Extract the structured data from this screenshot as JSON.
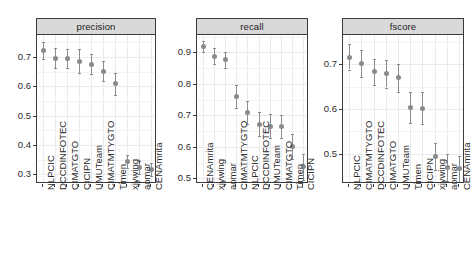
{
  "chart_data": {
    "type": "scatter",
    "title": "",
    "subtitle": "",
    "xlabel": "",
    "ylabel": "",
    "grid": true,
    "legend_position": "none",
    "facet_layout": "1x3",
    "marker": "point-with-error-bars",
    "colors": {
      "point": "#8a8a8a",
      "errorbar": "#8c8c8c",
      "strip_background": "#d9d9d9",
      "panel_border": "#3b3b3b",
      "grid_major": "#ebebeb",
      "grid_minor": "#f4f4f4",
      "panel_background": "#ffffff",
      "text": "#2b2b2b"
    },
    "panels": [
      {
        "name": "precision",
        "ylim": [
          0.27,
          0.775
        ],
        "yticks": [
          0.3,
          0.4,
          0.5,
          0.6,
          0.7
        ],
        "ytick_labels": [
          "0.3",
          "0.4",
          "0.5",
          "0.6",
          "0.7"
        ],
        "categories": [
          "NLPCIC",
          "DCCDINFOTEC",
          "CIMATGTO",
          "CICIPN",
          "UMUTeam",
          "CIMATMTYGTO",
          "Timen",
          "xjywing",
          "aomar",
          "CENAmrita"
        ],
        "values": [
          0.722,
          0.696,
          0.695,
          0.686,
          0.675,
          0.651,
          0.608,
          0.343,
          0.324,
          0.316
        ],
        "ci_lower": [
          0.692,
          0.663,
          0.662,
          0.645,
          0.641,
          0.617,
          0.57,
          0.32,
          0.302,
          0.295
        ],
        "ci_upper": [
          0.752,
          0.73,
          0.729,
          0.727,
          0.709,
          0.685,
          0.647,
          0.366,
          0.345,
          0.338
        ]
      },
      {
        "name": "recall",
        "ylim": [
          0.485,
          0.955
        ],
        "yticks": [
          0.5,
          0.6,
          0.7,
          0.8,
          0.9
        ],
        "ytick_labels": [
          "0.5",
          "0.6",
          "0.7",
          "0.8",
          "0.9"
        ],
        "categories": [
          "CENAmrita",
          "xjywing",
          "aomar",
          "CIMATMTYGTO",
          "NLPCIC",
          "DCCDINFOTEC",
          "UMUTeam",
          "CIMATGTO",
          "Timen",
          "CICIPN"
        ],
        "values": [
          0.918,
          0.888,
          0.876,
          0.76,
          0.71,
          0.672,
          0.665,
          0.664,
          0.601,
          0.536
        ],
        "ci_lower": [
          0.9,
          0.864,
          0.851,
          0.723,
          0.673,
          0.634,
          0.627,
          0.627,
          0.562,
          0.496
        ],
        "ci_upper": [
          0.936,
          0.913,
          0.901,
          0.795,
          0.745,
          0.71,
          0.703,
          0.701,
          0.64,
          0.577
        ]
      },
      {
        "name": "fscore",
        "ylim": [
          0.435,
          0.765
        ],
        "yticks": [
          0.5,
          0.6,
          0.7
        ],
        "ytick_labels": [
          "0.5",
          "0.6",
          "0.7"
        ],
        "categories": [
          "NLPCIC",
          "CIMATMTYGTO",
          "DCCDINFOTEC",
          "CIMATGTO",
          "UMUTeam",
          "Timen",
          "CICIPN",
          "xjywing",
          "aomar",
          "CENAmrita"
        ],
        "values": [
          0.715,
          0.702,
          0.683,
          0.679,
          0.67,
          0.604,
          0.602,
          0.494,
          0.47,
          0.467
        ],
        "ci_lower": [
          0.688,
          0.671,
          0.653,
          0.648,
          0.638,
          0.57,
          0.567,
          0.463,
          0.44,
          0.438
        ],
        "ci_upper": [
          0.744,
          0.731,
          0.712,
          0.71,
          0.7,
          0.638,
          0.637,
          0.524,
          0.499,
          0.495
        ]
      }
    ]
  }
}
